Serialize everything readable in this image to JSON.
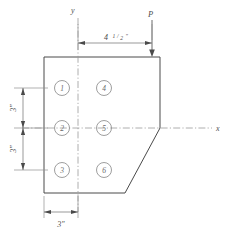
{
  "drawing": {
    "title": "Bolted plate connection with chamfered corner",
    "axes": {
      "y_label": "y",
      "x_label": "x"
    },
    "load": {
      "label": "P",
      "direction": "downward"
    },
    "dimensions": {
      "horizontal_offset": {
        "whole": "4",
        "numerator": "1",
        "denominator": "2",
        "unit": "\"",
        "full_text": "4 1/2\""
      },
      "vertical_upper": "3\"",
      "vertical_lower": "3\"",
      "bottom_width": "3\""
    },
    "bolts": [
      {
        "id": "1",
        "label": "1",
        "column": "left",
        "row": "top"
      },
      {
        "id": "2",
        "label": "2",
        "column": "left",
        "row": "middle"
      },
      {
        "id": "3",
        "label": "3",
        "column": "left",
        "row": "bottom"
      },
      {
        "id": "4",
        "label": "4",
        "column": "right",
        "row": "top"
      },
      {
        "id": "5",
        "label": "5",
        "column": "right",
        "row": "middle"
      },
      {
        "id": "6",
        "label": "6",
        "column": "right",
        "row": "bottom"
      }
    ],
    "colors": {
      "outline": "#4a4a4a",
      "centerline": "#9a9a9a",
      "bolt": "#8d8d8d",
      "dimension": "#6f6f6f",
      "background": "#ffffff"
    }
  }
}
